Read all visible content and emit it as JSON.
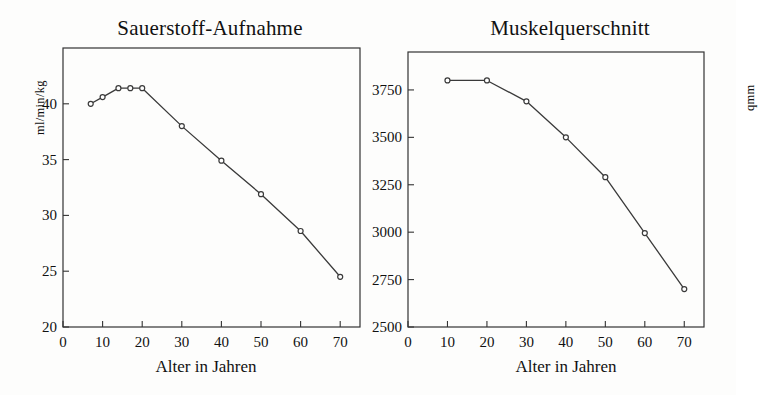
{
  "figure": {
    "background_color": "#fdfdfc",
    "ink_color": "#333333",
    "panels": 2
  },
  "chart_data": [
    {
      "type": "line",
      "title": "Sauerstoff-Aufnahme",
      "xlabel": "Alter in Jahren",
      "ylabel": "ml/min/kg",
      "xlim": [
        0,
        75
      ],
      "ylim": [
        20,
        45
      ],
      "xticks": [
        0,
        10,
        20,
        30,
        40,
        50,
        60,
        70
      ],
      "xticklabels": [
        "0",
        "10",
        "20",
        "30",
        "40",
        "50",
        "60",
        "70"
      ],
      "yticks": [
        20,
        25,
        30,
        35,
        40
      ],
      "yticklabels": [
        "20",
        "25",
        "30",
        "35",
        "40"
      ],
      "grid": false,
      "legend": "none",
      "marker": "open-circle",
      "x": [
        7,
        10,
        14,
        17,
        20,
        30,
        40,
        50,
        60,
        70
      ],
      "values": [
        40.0,
        40.6,
        41.4,
        41.4,
        41.4,
        38.0,
        34.9,
        31.9,
        28.6,
        24.5
      ]
    },
    {
      "type": "line",
      "title": "Muskelquerschnitt",
      "xlabel": "Alter in Jahren",
      "ylabel": "qmm",
      "xlim": [
        0,
        75
      ],
      "ylim": [
        2500,
        3950
      ],
      "xticks": [
        0,
        10,
        20,
        30,
        40,
        50,
        60,
        70
      ],
      "xticklabels": [
        "0",
        "10",
        "20",
        "30",
        "40",
        "50",
        "60",
        "70"
      ],
      "yticks": [
        2500,
        2750,
        3000,
        3250,
        3500,
        3750
      ],
      "yticklabels": [
        "2500",
        "2750",
        "3000",
        "3250",
        "3500",
        "3750"
      ],
      "grid": false,
      "legend": "none",
      "marker": "open-circle",
      "x": [
        10,
        20,
        30,
        40,
        50,
        60,
        70
      ],
      "values": [
        3800,
        3800,
        3690,
        3500,
        3290,
        2995,
        2700
      ]
    }
  ]
}
